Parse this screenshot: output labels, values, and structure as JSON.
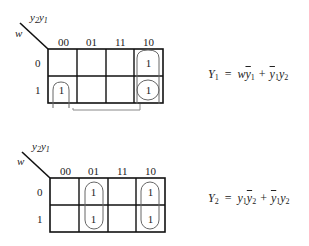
{
  "maps": [
    {
      "row_var": "w",
      "col_vars": {
        "a": "y",
        "a_sub": "2",
        "b": "y",
        "b_sub": "1"
      },
      "col_headers": [
        "00",
        "01",
        "11",
        "10"
      ],
      "row_headers": [
        "0",
        "1"
      ],
      "cells": [
        [
          "",
          "",
          "",
          "1"
        ],
        [
          "1",
          "",
          "",
          "1"
        ]
      ],
      "groups": [
        {
          "description": "column 10, rows 0-1 vertical pair"
        },
        {
          "description": "row 1 wraparound pair: columns 00 and 10"
        }
      ],
      "equation": {
        "lhs": "Y",
        "lhs_sub": "1",
        "eq": "=",
        "terms": [
          {
            "parts": [
              {
                "t": "w",
                "bar": false
              },
              {
                "t": "y",
                "sub": "1",
                "bar": true
              }
            ]
          },
          {
            "parts": [
              {
                "t": "y",
                "sub": "1",
                "bar": true
              },
              {
                "t": "y",
                "sub": "2",
                "bar": false
              }
            ]
          }
        ],
        "plus": "+"
      }
    },
    {
      "row_var": "w",
      "col_vars": {
        "a": "y",
        "a_sub": "2",
        "b": "y",
        "b_sub": "1"
      },
      "col_headers": [
        "00",
        "01",
        "11",
        "10"
      ],
      "row_headers": [
        "0",
        "1"
      ],
      "cells": [
        [
          "",
          "1",
          "",
          "1"
        ],
        [
          "",
          "1",
          "",
          "1"
        ]
      ],
      "groups": [
        {
          "description": "column 01, rows 0-1 vertical pair"
        },
        {
          "description": "column 10, rows 0-1 vertical pair"
        }
      ],
      "equation": {
        "lhs": "Y",
        "lhs_sub": "2",
        "eq": "=",
        "terms": [
          {
            "parts": [
              {
                "t": "y",
                "sub": "1",
                "bar": false
              },
              {
                "t": "y",
                "sub": "2",
                "bar": true
              }
            ]
          },
          {
            "parts": [
              {
                "t": "y",
                "sub": "1",
                "bar": true
              },
              {
                "t": "y",
                "sub": "2",
                "bar": false
              }
            ]
          }
        ],
        "plus": "+"
      }
    }
  ]
}
